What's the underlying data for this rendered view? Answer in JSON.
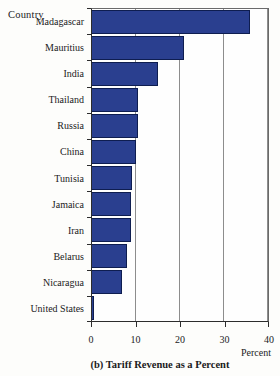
{
  "page": {
    "background": "#fdfdfb"
  },
  "chart": {
    "y_axis_title": "Country",
    "x_axis_title": "Percent",
    "caption": "(b) Tariff Revenue as a Percent",
    "bar_color": "#2a3f8f",
    "bar_border_color": "#0e1d50",
    "gridline_color": "#8d8d8d"
  },
  "chart_data": {
    "type": "bar",
    "orientation": "horizontal",
    "title": "(b) Tariff Revenue as a Percent",
    "xlabel": "Percent",
    "ylabel": "Country",
    "categories": [
      "Madagascar",
      "Mauritius",
      "India",
      "Thailand",
      "Russia",
      "China",
      "Tunisia",
      "Jamaica",
      "Iran",
      "Belarus",
      "Nicaragua",
      "United States"
    ],
    "values": [
      36,
      21,
      15,
      10.4,
      10.5,
      10.1,
      9.2,
      8.8,
      8.8,
      7.9,
      6.8,
      0.5
    ],
    "xlim": [
      0,
      40
    ],
    "x_ticks": [
      0,
      10,
      20,
      30,
      40
    ],
    "grid": true,
    "legend": false
  }
}
